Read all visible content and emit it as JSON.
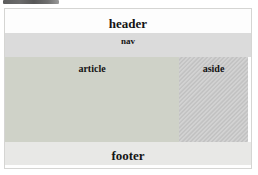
{
  "diagram": {
    "sections": {
      "header": {
        "label": "header",
        "bg": "#fdfdfd"
      },
      "nav": {
        "label": "nav",
        "bg": "#dbdbdb"
      },
      "article": {
        "label": "article",
        "bg": "#cfd2c8"
      },
      "aside": {
        "label": "aside",
        "bg": "#c8c8c8"
      },
      "footer": {
        "label": "footer",
        "bg": "#e8e8e6"
      }
    },
    "colors": {
      "page_background": "#fefefe",
      "page_border": "#d5d5d3",
      "label_text": "#141414",
      "top_artifact_strip": "#626262"
    }
  }
}
